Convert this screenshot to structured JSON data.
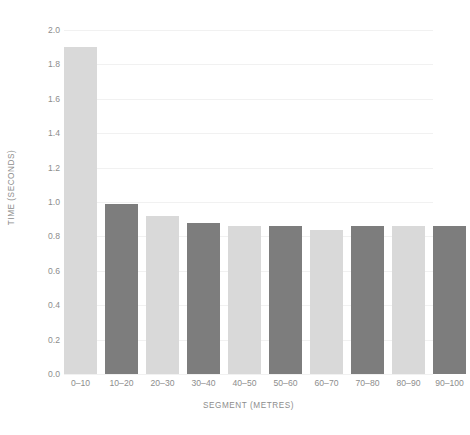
{
  "chart_data": {
    "type": "bar",
    "title": "",
    "xlabel": "SEGMENT (METRES)",
    "ylabel": "TIME (SECONDS)",
    "categories": [
      "0–10",
      "10–20",
      "20–30",
      "30–40",
      "40–50",
      "50–60",
      "60–70",
      "70–80",
      "80–90",
      "90–100"
    ],
    "values": [
      1.9,
      0.99,
      0.92,
      0.88,
      0.86,
      0.86,
      0.84,
      0.86,
      0.86,
      0.86
    ],
    "ylim": [
      0.0,
      2.0
    ],
    "ytick_labels": [
      "0.0",
      "0.2",
      "0.4",
      "0.6",
      "0.8",
      "1.0",
      "1.2",
      "1.4",
      "1.6",
      "1.8",
      "2.0"
    ],
    "ytick_values": [
      0.0,
      0.2,
      0.4,
      0.6,
      0.8,
      1.0,
      1.2,
      1.4,
      1.6,
      1.8,
      2.0
    ],
    "grid": true,
    "legend": false,
    "bar_colors": [
      "#d9d9d9",
      "#7d7d7d",
      "#d9d9d9",
      "#7d7d7d",
      "#d9d9d9",
      "#7d7d7d",
      "#d9d9d9",
      "#7d7d7d",
      "#d9d9d9",
      "#7d7d7d"
    ],
    "colors": {
      "light_bar": "#d9d9d9",
      "dark_bar": "#7d7d7d",
      "gridline": "#f1f1f1",
      "label_text": "#8d8d8d",
      "background": "#ffffff"
    }
  }
}
